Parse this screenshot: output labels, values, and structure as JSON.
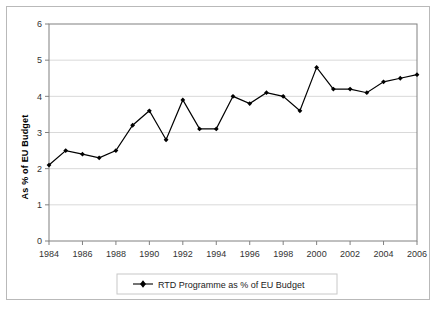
{
  "chart_data": {
    "type": "line",
    "title": "",
    "subtitle": "",
    "xlabel": "",
    "ylabel": "As % of EU Budget",
    "xlim": [
      1984,
      2006
    ],
    "ylim": [
      0,
      6
    ],
    "ytick_step": 1,
    "xtick_step": 2,
    "grid": true,
    "grid_axis": "y",
    "legend_position": "bottom",
    "marker": "diamond",
    "line_color": "#000000",
    "marker_color": "#000000",
    "series": [
      {
        "name": "RTD Programme as % of EU Budget",
        "x": [
          1984,
          1985,
          1986,
          1987,
          1988,
          1989,
          1990,
          1991,
          1992,
          1993,
          1994,
          1995,
          1996,
          1997,
          1998,
          1999,
          2000,
          2001,
          2002,
          2003,
          2004,
          2005,
          2006
        ],
        "values": [
          2.1,
          2.5,
          2.4,
          2.3,
          2.5,
          3.2,
          3.6,
          2.8,
          3.9,
          3.1,
          3.1,
          4.0,
          3.8,
          4.1,
          4.0,
          3.6,
          4.8,
          4.2,
          4.2,
          4.1,
          4.4,
          4.5,
          4.6
        ]
      }
    ],
    "ytick_labels": [
      "0",
      "1",
      "2",
      "3",
      "4",
      "5",
      "6"
    ],
    "xtick_labels": [
      "1984",
      "1986",
      "1988",
      "1990",
      "1992",
      "1994",
      "1996",
      "1998",
      "2000",
      "2002",
      "2004",
      "2006"
    ]
  },
  "legend": {
    "entries": [
      {
        "label": "RTD Programme as % of EU Budget",
        "marker": "diamond-line",
        "color": "#000000"
      }
    ]
  },
  "colors": {
    "plot_border": "#808080",
    "grid": "#d9d9d9",
    "outer_border": "#b9b9b9",
    "series": "#000000",
    "background": "#ffffff"
  }
}
